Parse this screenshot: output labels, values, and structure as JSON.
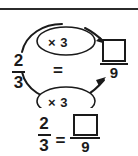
{
  "diagram": {
    "left_fraction": {
      "numerator": "2",
      "denominator": "3"
    },
    "center_equals": "=",
    "multiplier_top": "× 3",
    "multiplier_bottom": "× 3",
    "right_fraction": {
      "numerator": "",
      "denominator": "9"
    },
    "arrow_top_label": "× 3",
    "arrow_bottom_label": "× 3"
  },
  "bottom_equation": {
    "left_fraction": {
      "numerator": "2",
      "denominator": "3"
    },
    "equals": "=",
    "right_fraction": {
      "numerator": "",
      "denominator": "9"
    }
  },
  "colors": {
    "ink": "#1a1a1a",
    "rule": "#2b2b2b",
    "background": "#ffffff"
  }
}
